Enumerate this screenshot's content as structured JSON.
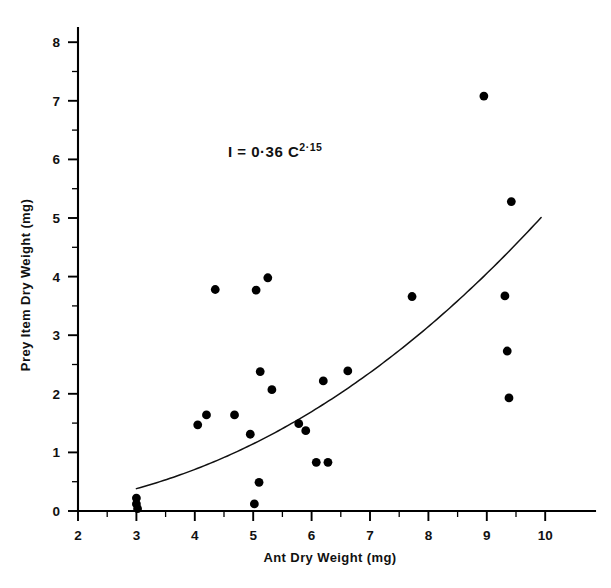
{
  "chart_data": {
    "type": "scatter",
    "title": "",
    "xlabel": "Ant Dry Weight (mg)",
    "ylabel": "Prey Item Dry Weight (mg)",
    "xlim": [
      2,
      10.6
    ],
    "ylim": [
      0,
      8.4
    ],
    "xticks": [
      2,
      3,
      4,
      5,
      6,
      7,
      8,
      9,
      10
    ],
    "xtick_labels": [
      "2",
      "3",
      "4",
      "5",
      "6",
      "7",
      "8",
      "9",
      "10"
    ],
    "yticks": [
      0,
      1,
      2,
      3,
      4,
      5,
      6,
      7,
      8
    ],
    "ytick_labels": [
      "0",
      "1",
      "2",
      "3",
      "4",
      "5",
      "6",
      "7",
      "8"
    ],
    "x_minor_ticks": [
      2.5,
      3.5,
      4.5,
      5.5,
      6.5,
      7.5,
      8.5,
      9.5
    ],
    "y_minor_ticks": [
      0.5,
      1.5,
      2.5,
      3.5,
      4.5,
      5.5,
      6.5,
      7.5
    ],
    "grid": false,
    "legend": null,
    "annotation": {
      "text": "I =  0·36 C",
      "exponent": "2·15",
      "full_text": "I = 0·36 C^2·15",
      "x": 4.6,
      "y": 6.05
    },
    "points": [
      {
        "x": 3.0,
        "y": 0.22
      },
      {
        "x": 3.0,
        "y": 0.12
      },
      {
        "x": 3.02,
        "y": 0.04
      },
      {
        "x": 4.05,
        "y": 1.47
      },
      {
        "x": 4.2,
        "y": 1.64
      },
      {
        "x": 4.35,
        "y": 3.78
      },
      {
        "x": 4.68,
        "y": 1.64
      },
      {
        "x": 4.95,
        "y": 1.31
      },
      {
        "x": 5.02,
        "y": 0.12
      },
      {
        "x": 5.05,
        "y": 3.77
      },
      {
        "x": 5.1,
        "y": 0.49
      },
      {
        "x": 5.12,
        "y": 2.38
      },
      {
        "x": 5.25,
        "y": 3.98
      },
      {
        "x": 5.32,
        "y": 2.07
      },
      {
        "x": 5.78,
        "y": 1.49
      },
      {
        "x": 5.9,
        "y": 1.37
      },
      {
        "x": 6.08,
        "y": 0.83
      },
      {
        "x": 6.28,
        "y": 0.83
      },
      {
        "x": 6.2,
        "y": 2.22
      },
      {
        "x": 6.62,
        "y": 2.39
      },
      {
        "x": 7.72,
        "y": 3.66
      },
      {
        "x": 8.95,
        "y": 7.08
      },
      {
        "x": 9.31,
        "y": 3.67
      },
      {
        "x": 9.42,
        "y": 5.28
      },
      {
        "x": 9.35,
        "y": 2.73
      },
      {
        "x": 9.38,
        "y": 1.93
      }
    ],
    "fit": {
      "label": "power-law fit",
      "equation": "I = 0.36 * C^2.15",
      "coefficient": 0.36,
      "exponent": 2.15,
      "x_start": 3.0,
      "x_end": 9.93
    }
  }
}
